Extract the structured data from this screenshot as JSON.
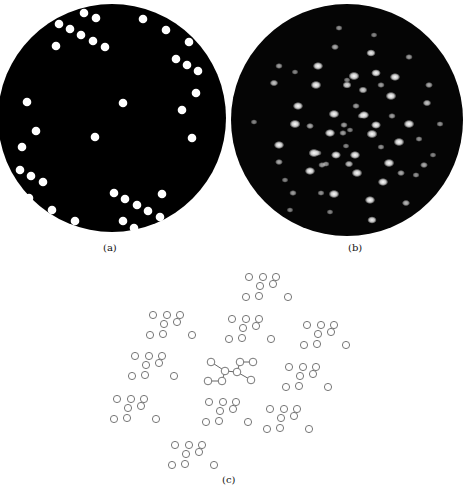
{
  "figure": {
    "panels": [
      {
        "id": "a",
        "label": "(a)",
        "description": "Opaque mask with circular holes",
        "mask_color": "#000000",
        "hole_color": "#ffffff",
        "holes": [
          [
            84,
            13
          ],
          [
            96,
            18
          ],
          [
            59,
            24
          ],
          [
            70,
            29
          ],
          [
            81,
            35
          ],
          [
            93,
            41
          ],
          [
            105,
            47
          ],
          [
            56,
            46
          ],
          [
            143,
            19
          ],
          [
            166,
            30
          ],
          [
            189,
            42
          ],
          [
            176,
            59
          ],
          [
            187,
            65
          ],
          [
            198,
            71
          ],
          [
            196,
            93
          ],
          [
            182,
            110
          ],
          [
            27,
            102
          ],
          [
            123,
            103
          ],
          [
            36,
            131
          ],
          [
            22,
            147
          ],
          [
            95,
            137
          ],
          [
            192,
            138
          ],
          [
            20,
            170
          ],
          [
            31,
            176
          ],
          [
            43,
            182
          ],
          [
            29,
            198
          ],
          [
            52,
            210
          ],
          [
            75,
            221
          ],
          [
            114,
            193
          ],
          [
            125,
            199
          ],
          [
            137,
            205
          ],
          [
            148,
            211
          ],
          [
            162,
            194
          ],
          [
            160,
            217
          ],
          [
            123,
            221
          ],
          [
            134,
            228
          ]
        ]
      },
      {
        "id": "b",
        "label": "(b)",
        "description": "Optical diffraction pattern of mask (a)",
        "background_color": "#050505",
        "spots": [
          [
            339,
            28,
            0.35
          ],
          [
            374,
            35,
            0.3
          ],
          [
            335,
            47,
            0.45
          ],
          [
            371,
            53,
            0.7
          ],
          [
            409,
            57,
            0.4
          ],
          [
            376,
            73,
            0.75
          ],
          [
            347,
            80,
            0.3
          ],
          [
            279,
            66,
            0.4
          ],
          [
            318,
            66,
            0.85
          ],
          [
            295,
            72,
            0.3
          ],
          [
            354,
            76,
            0.95
          ],
          [
            395,
            77,
            0.85
          ],
          [
            381,
            85,
            0.4
          ],
          [
            274,
            83,
            0.55
          ],
          [
            316,
            85,
            0.9
          ],
          [
            347,
            85,
            0.65
          ],
          [
            363,
            90,
            0.6
          ],
          [
            391,
            96,
            0.9
          ],
          [
            429,
            85,
            0.45
          ],
          [
            298,
            106,
            0.85
          ],
          [
            364,
            115,
            0.85
          ],
          [
            392,
            116,
            0.4
          ],
          [
            427,
            103,
            0.55
          ],
          [
            356,
            106,
            0.4
          ],
          [
            334,
            114,
            0.9
          ],
          [
            361,
            116,
            0.35
          ],
          [
            295,
            124,
            0.95
          ],
          [
            310,
            126,
            0.45
          ],
          [
            344,
            125,
            0.4
          ],
          [
            376,
            125,
            0.8
          ],
          [
            409,
            124,
            0.9
          ],
          [
            330,
            133,
            0.85
          ],
          [
            343,
            133,
            0.4
          ],
          [
            372,
            134,
            0.95
          ],
          [
            350,
            130,
            0.3
          ],
          [
            399,
            142,
            0.9
          ],
          [
            419,
            139,
            0.35
          ],
          [
            279,
            145,
            0.85
          ],
          [
            318,
            153,
            0.4
          ],
          [
            346,
            146,
            0.3
          ],
          [
            336,
            155,
            0.8
          ],
          [
            355,
            155,
            0.85
          ],
          [
            381,
            147,
            0.35
          ],
          [
            314,
            153,
            0.95
          ],
          [
            326,
            164,
            0.35
          ],
          [
            349,
            164,
            0.55
          ],
          [
            389,
            163,
            0.9
          ],
          [
            424,
            165,
            0.45
          ],
          [
            279,
            162,
            0.45
          ],
          [
            310,
            171,
            0.85
          ],
          [
            322,
            165,
            0.4
          ],
          [
            357,
            173,
            0.9
          ],
          [
            383,
            182,
            0.85
          ],
          [
            401,
            173,
            0.45
          ],
          [
            416,
            175,
            0.35
          ],
          [
            293,
            193,
            0.4
          ],
          [
            321,
            193,
            0.35
          ],
          [
            334,
            194,
            0.9
          ],
          [
            370,
            200,
            0.85
          ],
          [
            406,
            203,
            0.5
          ],
          [
            372,
            220,
            0.7
          ],
          [
            290,
            210,
            0.3
          ],
          [
            330,
            212,
            0.3
          ],
          [
            285,
            180,
            0.3
          ],
          [
            440,
            124,
            0.35
          ],
          [
            254,
            122,
            0.3
          ],
          [
            433,
            155,
            0.3
          ]
        ]
      },
      {
        "id": "c",
        "label": "(c)",
        "description": "Lattice of repeated 8-atom motifs; central motif shows bonds",
        "circle_stroke_color": "#777777",
        "bond_color": "#555555",
        "motif_offsets": [
          [
            0,
            0
          ],
          [
            14,
            0
          ],
          [
            27,
            0
          ],
          [
            11,
            9
          ],
          [
            24,
            7
          ],
          [
            -3,
            20
          ],
          [
            10,
            19
          ],
          [
            39,
            20
          ]
        ],
        "motif_origins": [
          [
            249,
            277
          ],
          [
            153,
            315
          ],
          [
            232,
            319
          ],
          [
            307,
            325
          ],
          [
            135,
            356
          ],
          [
            289,
            367
          ],
          [
            117,
            399
          ],
          [
            209,
            402
          ],
          [
            270,
            409
          ],
          [
            175,
            445
          ]
        ],
        "central_motif": {
          "atoms": [
            [
              211,
              362
            ],
            [
              225,
              371
            ],
            [
              222,
              381
            ],
            [
              208,
              381
            ],
            [
              240,
              362
            ],
            [
              253,
              362
            ],
            [
              237,
              372
            ],
            [
              251,
              380
            ]
          ],
          "bonds": [
            [
              0,
              1
            ],
            [
              1,
              2
            ],
            [
              2,
              3
            ],
            [
              1,
              6
            ],
            [
              4,
              5
            ],
            [
              4,
              6
            ],
            [
              6,
              7
            ]
          ]
        }
      }
    ]
  }
}
